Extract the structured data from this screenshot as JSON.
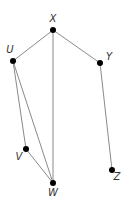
{
  "diagram": {
    "type": "graph",
    "nodes": [
      {
        "id": "X",
        "label": "X",
        "x": 53,
        "y": 30,
        "lx": 53,
        "ly": 22
      },
      {
        "id": "U",
        "label": "U",
        "x": 13,
        "y": 61,
        "lx": 10,
        "ly": 53
      },
      {
        "id": "Y",
        "label": "Y",
        "x": 100,
        "y": 63,
        "lx": 109,
        "ly": 60
      },
      {
        "id": "V",
        "label": "V",
        "x": 26,
        "y": 149,
        "lx": 19,
        "ly": 160
      },
      {
        "id": "W",
        "label": "W",
        "x": 53,
        "y": 183,
        "lx": 53,
        "ly": 196
      },
      {
        "id": "Z",
        "label": "Z",
        "x": 112,
        "y": 170,
        "lx": 117,
        "ly": 180
      }
    ],
    "edges": [
      [
        "X",
        "U"
      ],
      [
        "X",
        "W"
      ],
      [
        "X",
        "Y"
      ],
      [
        "U",
        "V"
      ],
      [
        "U",
        "W"
      ],
      [
        "V",
        "W"
      ],
      [
        "Y",
        "Z"
      ]
    ],
    "colors": {
      "edge": "#8a8a8a",
      "node": "#000000",
      "label": "#333333"
    }
  }
}
